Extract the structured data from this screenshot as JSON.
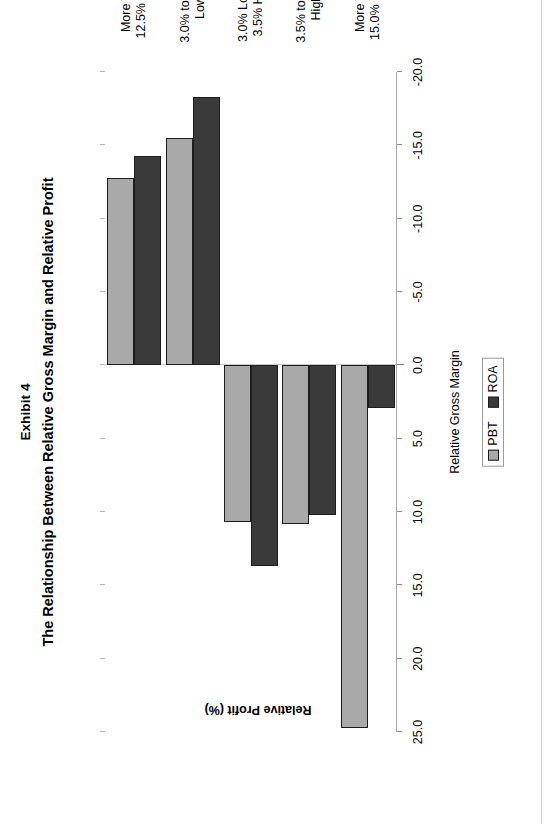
{
  "chart_data": {
    "type": "bar",
    "orientation": "vertical",
    "title": "The Relationship Between Relative Gross Margin and Relative Profit",
    "exhibit_label": "Exhibit 4",
    "subtitle": "",
    "xlabel": "Relative Gross Margin",
    "ylabel": "Relative Profit (%)",
    "ylim": [
      -20.0,
      25.0
    ],
    "grid": false,
    "legend_position": "bottom",
    "categories": [
      "More Than\n12.5% Lower",
      "3.0% to 12.5%\nLower",
      "3.0% Lower to\n3.5% Higher",
      "3.5% to 15.0%\nHigher",
      "More Than\n15.0% Higher"
    ],
    "series": [
      {
        "name": "PBT",
        "color": "#a9a9a9",
        "values": [
          -12.8,
          -15.5,
          10.7,
          10.8,
          24.7
        ]
      },
      {
        "name": "ROA",
        "color": "#3a3a3a",
        "values": [
          -14.3,
          -18.3,
          13.7,
          10.2,
          2.9
        ]
      }
    ],
    "ytick_labels": [
      "25.0",
      "20.0",
      "15.0",
      "10.0",
      "5.0",
      "0.0",
      "-5.0",
      "-10.0",
      "-15.0",
      "-20.0"
    ],
    "ytick_values": [
      25.0,
      20.0,
      15.0,
      10.0,
      5.0,
      0.0,
      -5.0,
      -10.0,
      -15.0,
      -20.0
    ]
  },
  "legend": {
    "items": [
      {
        "label": "PBT",
        "color": "#a9a9a9"
      },
      {
        "label": "ROA",
        "color": "#3a3a3a"
      }
    ]
  }
}
